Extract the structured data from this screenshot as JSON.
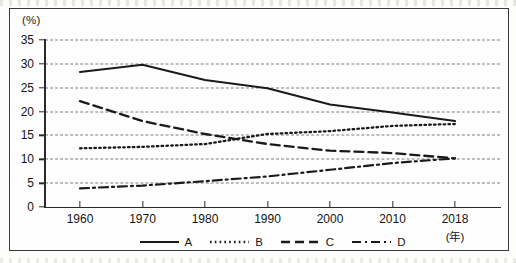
{
  "figure": {
    "y_unit_label": "(%)",
    "x_unit_label": "(年)"
  },
  "chart_data": {
    "type": "line",
    "title": "",
    "subtitle": "",
    "xlabel": "(年)",
    "ylabel": "(%)",
    "x": [
      1960,
      1970,
      1980,
      1990,
      2000,
      2010,
      2018
    ],
    "xtick_labels": [
      "1960",
      "1970",
      "1980",
      "1990",
      "2000",
      "2010",
      "2018"
    ],
    "ytick_labels": [
      "0",
      "5",
      "10",
      "15",
      "20",
      "25",
      "30",
      "35"
    ],
    "yticks": [
      0,
      5,
      10,
      15,
      20,
      25,
      30,
      35
    ],
    "xlim": [
      1955,
      2023
    ],
    "ylim": [
      0,
      35
    ],
    "grid": "horizontal-dashed",
    "legend_position": "below-axis-center",
    "series": [
      {
        "name": "A",
        "style": "solid",
        "color": "#1a1a1a",
        "values": [
          28.3,
          29.8,
          26.6,
          24.9,
          21.5,
          19.8,
          18.0
        ]
      },
      {
        "name": "B",
        "style": "dotted",
        "color": "#1a1a1a",
        "values": [
          12.3,
          12.6,
          13.2,
          15.3,
          15.9,
          17.0,
          17.4
        ]
      },
      {
        "name": "C",
        "style": "dashed",
        "color": "#1a1a1a",
        "values": [
          22.2,
          18.0,
          15.3,
          13.2,
          11.8,
          11.3,
          10.2
        ]
      },
      {
        "name": "D",
        "style": "dash-dot",
        "color": "#1a1a1a",
        "values": [
          3.9,
          4.5,
          5.4,
          6.4,
          7.8,
          9.2,
          10.2
        ]
      }
    ]
  },
  "legend": {
    "items": [
      {
        "label": "A",
        "style": "solid"
      },
      {
        "label": "B",
        "style": "dotted"
      },
      {
        "label": "C",
        "style": "dashed"
      },
      {
        "label": "D",
        "style": "dash-dot"
      }
    ]
  },
  "colors": {
    "ink": "#1a1a1a",
    "axis": "#2b2b2b",
    "grid": "#7d7d7d",
    "border": "#3a3a3a",
    "paper": "#fefefe"
  }
}
